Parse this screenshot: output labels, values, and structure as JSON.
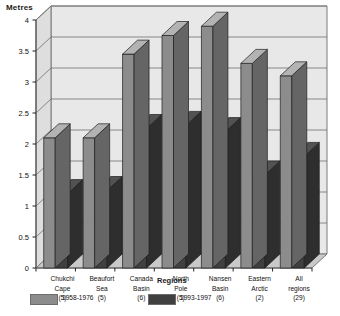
{
  "chart_data": {
    "type": "bar",
    "title": "",
    "ylabel": "Metres",
    "xlabel": "Regions",
    "ylim": [
      0,
      4
    ],
    "ytick_step": 0.5,
    "yticks": [
      "0",
      "0.5",
      "1",
      "1.5",
      "2",
      "2.5",
      "3",
      "3.5",
      "4"
    ],
    "grid": true,
    "legend_position": "bottom-left",
    "style": "3d-column",
    "categories": [
      "Chukchi Cape (5)",
      "Beaufort Sea (5)",
      "Canada Basin (6)",
      "North Pole (5)",
      "Nansen Basin (6)",
      "Eastern Arctic (2)",
      "All regions (29)"
    ],
    "category_lines": [
      [
        "Chukchi",
        "Cape",
        "(5)"
      ],
      [
        "Beaufort",
        "Sea",
        "(5)"
      ],
      [
        "Canada",
        "Basin",
        "(6)"
      ],
      [
        "North",
        "Pole",
        "(5)"
      ],
      [
        "Nansen",
        "Basin",
        "(6)"
      ],
      [
        "Eastern",
        "Arctic",
        "(2)"
      ],
      [
        "All",
        "regions",
        "(29)"
      ]
    ],
    "series": [
      {
        "name": "1958-1976",
        "color": "#8c8c8c",
        "values": [
          2.1,
          2.1,
          3.45,
          3.75,
          3.9,
          3.3,
          3.1
        ]
      },
      {
        "name": "1993-1997",
        "color": "#404040",
        "values": [
          1.2,
          1.25,
          2.25,
          2.3,
          2.2,
          1.5,
          1.8
        ]
      }
    ]
  },
  "colors": {
    "series1": "#8c8c8c",
    "series2": "#404040",
    "plot_back": "#e8e8e8",
    "plot_floor": "#c9c9c9",
    "grid": "#6e6e6e",
    "axis": "#555555"
  }
}
